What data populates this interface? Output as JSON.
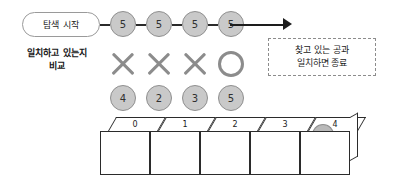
{
  "diagram": {
    "start_label": "탐색 시작",
    "compare_label_line1": "일치하고 있는지",
    "compare_label_line2": "비교",
    "note_line1": "찾고 있는 공과",
    "note_line2": "일치하면 종료",
    "search_key": "5",
    "key_circles": [
      "5",
      "5",
      "5",
      "5"
    ],
    "compare_marks": [
      "x-mark",
      "x-mark",
      "x-mark",
      "o-mark"
    ],
    "array_values": [
      "4",
      "2",
      "3",
      "5"
    ],
    "box_indices": [
      "0",
      "1",
      "2",
      "3",
      "4"
    ],
    "ball_in_box_index": "4",
    "colors": {
      "ball_fill": "#c9c9c9",
      "ball_stroke": "#8f8f8f",
      "mark_gray": "#8c8c8c",
      "line_dark": "#2b2b2b",
      "note_border": "#8c8c8c",
      "background": "#ffffff"
    }
  }
}
